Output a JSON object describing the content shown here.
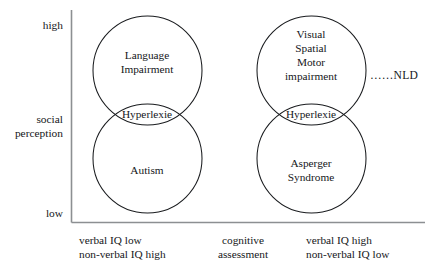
{
  "diagram": {
    "axes": {
      "y_axis_name_line1": "social",
      "y_axis_name_line2": "perception",
      "y_top_tick": "high",
      "y_bottom_tick": "low",
      "x_axis_center_label_line1": "cognitive",
      "x_axis_center_label_line2": "assessment"
    },
    "bottom_labels": {
      "left_line1": "verbal IQ low",
      "left_line2": "non-verbal IQ high",
      "right_line1": "verbal IQ high",
      "right_line2": "non-verbal IQ low"
    },
    "left_group": {
      "top_circle_line1": "Language",
      "top_circle_line2": "Impairment",
      "overlap_label": "Hyperlexie",
      "bottom_circle_label": "Autism"
    },
    "right_group": {
      "top_circle_line1": "Visual",
      "top_circle_line2": "Spatial",
      "top_circle_line3": "Motor",
      "top_circle_line4": "impairment",
      "overlap_label": "Hyperlexie",
      "bottom_circle_line1": "Asperger",
      "bottom_circle_line2": "Syndrome"
    },
    "annotation": {
      "leader_dots": "……",
      "text": "NLD"
    },
    "colors": {
      "background": "#ffffff",
      "text": "#15171a",
      "circle_stroke": "#1a1c1f",
      "axis_stroke": "#8c8f92"
    }
  }
}
